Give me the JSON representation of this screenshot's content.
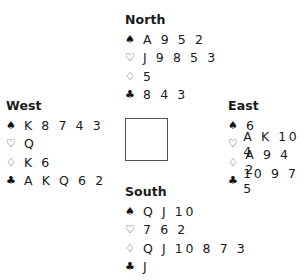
{
  "hands": {
    "north": {
      "label": "North",
      "spades": "A 9 5 2",
      "hearts": "J 9 8 5 3",
      "diamonds": "5",
      "clubs": "8 4 3"
    },
    "west": {
      "label": "West",
      "spades": "K 8 7 4 3",
      "hearts": "Q",
      "diamonds": "K 6",
      "clubs": "A K Q 6 2"
    },
    "east": {
      "label": "East",
      "spades": "6",
      "hearts": "A K 10 4",
      "diamonds": "A 9 4 2",
      "clubs": "10 9 7 5"
    },
    "south": {
      "label": "South",
      "spades": "Q J 10",
      "hearts": "7 6 2",
      "diamonds": "Q J 10 8 7 3",
      "clubs": "J"
    }
  },
  "suits": {
    "spades": "♠",
    "hearts": "♡",
    "diamonds": "♢",
    "clubs": "♣"
  }
}
